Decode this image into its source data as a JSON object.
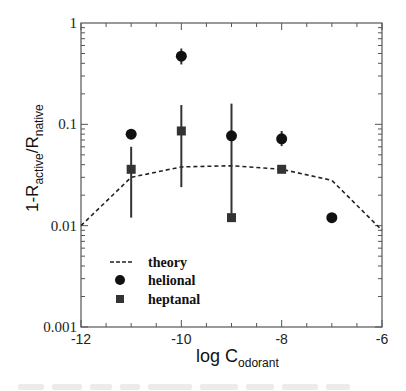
{
  "chart_data": {
    "type": "scatter",
    "title": "",
    "xlabel": "log C",
    "xlabel_subscript": "odorant",
    "ylabel_parts": [
      "1-R",
      "active",
      "/R",
      "native"
    ],
    "xlim": [
      -12,
      -6
    ],
    "ylim": [
      0.001,
      1
    ],
    "yscale": "log",
    "grid": false,
    "x_ticks": [
      {
        "value": -12,
        "label": "-12"
      },
      {
        "value": -10,
        "label": "-10"
      },
      {
        "value": -8,
        "label": "-8"
      },
      {
        "value": -6,
        "label": "-6"
      }
    ],
    "y_ticks": [
      {
        "value": 1,
        "label": "1"
      },
      {
        "value": 0.1,
        "label": "0.1"
      },
      {
        "value": 0.01,
        "label": "0.01"
      },
      {
        "value": 0.001,
        "label": "0.001"
      }
    ],
    "legend": {
      "position": "lower-left-inside",
      "entries": [
        {
          "label": "theory",
          "marker": "dashed-line"
        },
        {
          "label": "helional",
          "marker": "circle"
        },
        {
          "label": "heptanal",
          "marker": "square"
        }
      ]
    },
    "series": [
      {
        "name": "theory",
        "style": "dashed-line",
        "x": [
          -12,
          -11,
          -10,
          -9,
          -8,
          -7,
          -6
        ],
        "y": [
          0.01,
          0.03,
          0.038,
          0.039,
          0.036,
          0.028,
          0.009
        ]
      },
      {
        "name": "helional",
        "style": "circle",
        "color": "#111111",
        "x": [
          -11,
          -10,
          -9,
          -8,
          -7
        ],
        "y": [
          0.08,
          0.47,
          0.077,
          0.072,
          0.012
        ],
        "err_low": [
          null,
          0.39,
          null,
          0.061,
          null
        ],
        "err_high": [
          null,
          0.56,
          null,
          0.086,
          null
        ]
      },
      {
        "name": "heptanal",
        "style": "square",
        "color": "#333333",
        "x": [
          -11,
          -10,
          -9,
          -8
        ],
        "y": [
          0.036,
          0.086,
          0.012,
          0.036
        ],
        "err_low": [
          0.012,
          0.024,
          0.012,
          null
        ],
        "err_high": [
          0.06,
          0.155,
          0.16,
          null
        ]
      }
    ]
  }
}
